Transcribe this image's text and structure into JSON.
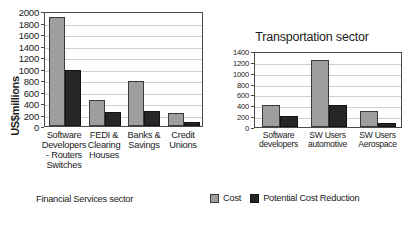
{
  "chart_data": [
    {
      "type": "bar",
      "id": "financial-services",
      "title": "",
      "xlabel": "Financial Services sector",
      "ylabel": "US$millions",
      "ylim": [
        0,
        2000
      ],
      "ytick_step": 200,
      "yticks": [
        "2000",
        "1800",
        "1600",
        "1400",
        "1200",
        "1000",
        "800",
        "600",
        "400",
        "200",
        "0"
      ],
      "grid": true,
      "legend_position": "bottom-right",
      "categories": [
        "Software Developers - Routers Switches",
        "FEDI & Clearing Houses",
        "Banks & Savings",
        "Credit Unions"
      ],
      "category_lines": [
        [
          "Software",
          "Developers",
          "- Routers",
          "Switches"
        ],
        [
          "FEDI &",
          "Clearing",
          "Houses"
        ],
        [
          "Banks &",
          "Savings"
        ],
        [
          "Credit",
          "Unions"
        ]
      ],
      "series": [
        {
          "name": "Cost",
          "color": "#9e9e9e",
          "values": [
            1890,
            450,
            790,
            220
          ]
        },
        {
          "name": "Potential Cost Reduction",
          "color": "#262626",
          "values": [
            975,
            240,
            255,
            75
          ]
        }
      ]
    },
    {
      "type": "bar",
      "id": "transportation",
      "title": "Transportation sector",
      "xlabel": "",
      "ylabel": "",
      "ylim": [
        0,
        1400
      ],
      "ytick_step": 200,
      "yticks": [
        "1400",
        "1200",
        "1000",
        "800",
        "600",
        "400",
        "200",
        "0"
      ],
      "grid": true,
      "legend_position": "shared",
      "categories": [
        "Software developers",
        "SW Users automotive",
        "SW Users Aerospace"
      ],
      "category_lines": [
        [
          "Software",
          "developers"
        ],
        [
          "SW Users",
          "automotive"
        ],
        [
          "SW Users",
          "Aerospace"
        ]
      ],
      "series": [
        {
          "name": "Cost",
          "color": "#9e9e9e",
          "values": [
            400,
            1230,
            290
          ]
        },
        {
          "name": "Potential Cost Reduction",
          "color": "#262626",
          "values": [
            200,
            400,
            75
          ]
        }
      ]
    }
  ],
  "legend": {
    "items": [
      {
        "label": "Cost",
        "color": "#9e9e9e"
      },
      {
        "label": "Potential Cost Reduction",
        "color": "#262626"
      }
    ]
  },
  "colors": {
    "cost": "#9e9e9e",
    "reduction": "#262626",
    "axis": "#4a4a4a",
    "grid": "#cfcfcf",
    "background": "#ffffff"
  }
}
